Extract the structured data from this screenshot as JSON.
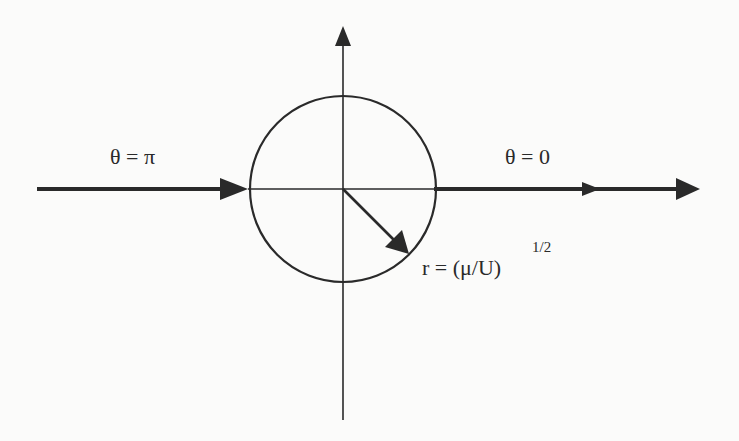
{
  "figure": {
    "type": "diagram",
    "colors": {
      "background": "#fbfbfa",
      "stroke": "#2a2a2a"
    },
    "geometry": {
      "center": [
        343,
        189
      ],
      "circle_radius": 93,
      "vertical_axis": {
        "y_top": 26,
        "y_bottom": 420
      },
      "incoming_stream": {
        "x_start": 37,
        "x_end": 248
      },
      "outgoing_stream": {
        "x_start": 434,
        "x_end": 700,
        "mid_arrow_x": 600
      },
      "radius_arrow_end": [
        408,
        254
      ]
    }
  },
  "labels": {
    "theta_pi": "θ = π",
    "theta_zero": "θ = 0",
    "radius": "r = (μ/U)",
    "radius_exponent": "1/2"
  }
}
